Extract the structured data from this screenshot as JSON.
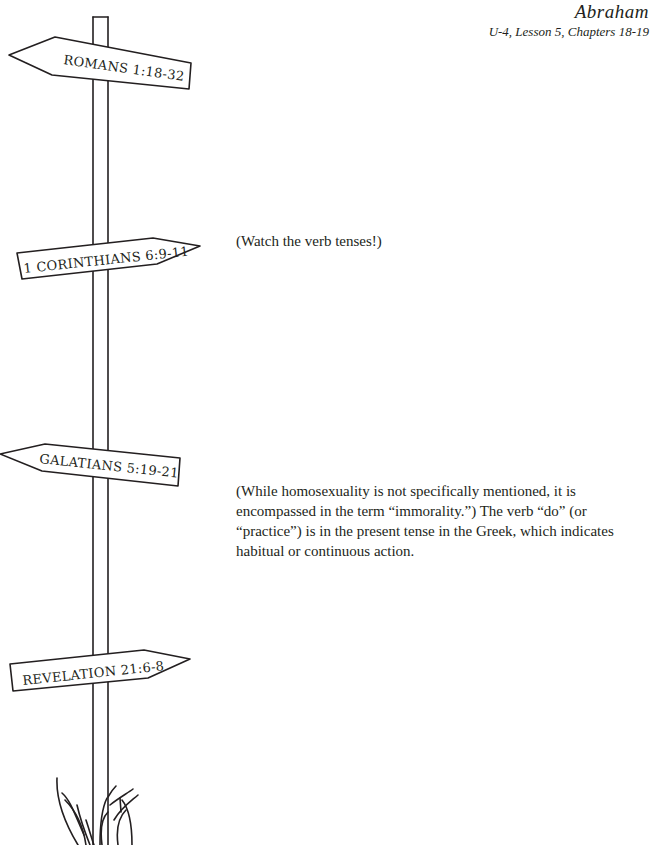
{
  "header": {
    "title": "Abraham",
    "subtitle": "U-4, Lesson 5, Chapters 18-19"
  },
  "signs": [
    {
      "label": "ROMANS 1:18-32",
      "direction": "left"
    },
    {
      "label": "1 CORINTHIANS 6:9-11",
      "direction": "right"
    },
    {
      "label": "GALATIANS 5:19-21",
      "direction": "left"
    },
    {
      "label": "REVELATION 21:6-8",
      "direction": "right"
    }
  ],
  "notes": {
    "corinthians": "(Watch the verb tenses!)",
    "galatians": "(While homosexuality is not specifically mentioned, it is encompassed in the term “immorality.”) The verb “do” (or “practice”) is in the present tense in the Greek, which indicates habitual or continuous action."
  },
  "colors": {
    "ink": "#231f20",
    "background": "#ffffff"
  }
}
